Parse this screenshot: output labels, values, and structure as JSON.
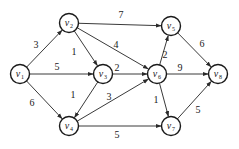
{
  "graph": {
    "type": "directed-weighted",
    "nodes": [
      {
        "id": "v1",
        "name": "v",
        "sub": "1",
        "x": 20,
        "y": 74
      },
      {
        "id": "v2",
        "name": "v",
        "sub": "2",
        "x": 69,
        "y": 23
      },
      {
        "id": "v3",
        "name": "v",
        "sub": "3",
        "x": 103,
        "y": 74
      },
      {
        "id": "v4",
        "name": "v",
        "sub": "4",
        "x": 69,
        "y": 126
      },
      {
        "id": "v5",
        "name": "v",
        "sub": "5",
        "x": 171,
        "y": 26
      },
      {
        "id": "v6",
        "name": "v",
        "sub": "6",
        "x": 157,
        "y": 74
      },
      {
        "id": "v7",
        "name": "v",
        "sub": "7",
        "x": 171,
        "y": 126
      },
      {
        "id": "v8",
        "name": "v",
        "sub": "8",
        "x": 218,
        "y": 74
      }
    ],
    "edges": [
      {
        "from": "v1",
        "to": "v2",
        "weight": "3",
        "lx": 36,
        "ly": 48
      },
      {
        "from": "v1",
        "to": "v3",
        "weight": "5",
        "lx": 57,
        "ly": 70
      },
      {
        "from": "v1",
        "to": "v4",
        "weight": "6",
        "lx": 32,
        "ly": 106
      },
      {
        "from": "v2",
        "to": "v5",
        "weight": "7",
        "lx": 121,
        "ly": 18
      },
      {
        "from": "v2",
        "to": "v3",
        "weight": "1",
        "lx": 74,
        "ly": 55
      },
      {
        "from": "v2",
        "to": "v6",
        "weight": "4",
        "lx": 116,
        "ly": 48
      },
      {
        "from": "v3",
        "to": "v4",
        "weight": "1",
        "lx": 73,
        "ly": 98
      },
      {
        "from": "v3",
        "to": "v6",
        "weight": "2",
        "lx": 117,
        "ly": 71
      },
      {
        "from": "v4",
        "to": "v6",
        "weight": "3",
        "lx": 109,
        "ly": 100
      },
      {
        "from": "v4",
        "to": "v7",
        "weight": "5",
        "lx": 117,
        "ly": 138
      },
      {
        "from": "v6",
        "to": "v5",
        "weight": "2",
        "lx": 165,
        "ly": 58
      },
      {
        "from": "v6",
        "to": "v8",
        "weight": "9",
        "lx": 180,
        "ly": 71
      },
      {
        "from": "v6",
        "to": "v7",
        "weight": "1",
        "lx": 156,
        "ly": 103
      },
      {
        "from": "v5",
        "to": "v8",
        "weight": "6",
        "lx": 202,
        "ly": 47
      },
      {
        "from": "v7",
        "to": "v8",
        "weight": "5",
        "lx": 198,
        "ly": 113
      }
    ]
  }
}
